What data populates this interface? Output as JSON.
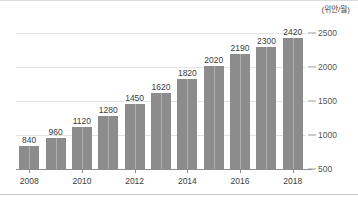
{
  "chart_data": {
    "type": "bar",
    "title": "",
    "subtitle": "",
    "unit_label": "(위안/월)",
    "xlabel": "",
    "ylabel": "",
    "categories": [
      "2008",
      "2009",
      "2010",
      "2011",
      "2012",
      "2013",
      "2014",
      "2015",
      "2016",
      "2017",
      "2018"
    ],
    "values": [
      840,
      960,
      1120,
      1280,
      1450,
      1620,
      1820,
      2020,
      2190,
      2300,
      2420
    ],
    "data_labels": [
      "840",
      "960",
      "1120",
      "1280",
      "1450",
      "1620",
      "1820",
      "2020",
      "2190",
      "2300",
      "2420"
    ],
    "ylim": [
      500,
      2500
    ],
    "ytick_values": [
      500,
      1000,
      1500,
      2000,
      2500
    ],
    "ytick_labels": [
      "500",
      "1000",
      "1500",
      "2000",
      "2500"
    ],
    "xtick_labels": [
      "2008",
      "2010",
      "2012",
      "2014",
      "2016",
      "2018"
    ],
    "xtick_categories": [
      "2008",
      "2010",
      "2012",
      "2014",
      "2016",
      "2018"
    ],
    "grid": true,
    "grid_axis": "y",
    "legend": false,
    "legend_position": "none",
    "y_axis_position": "right",
    "bar_color": "#8c8c8c",
    "gridline_color": "#e2e2e2",
    "axis_color": "#8d8d8d",
    "text_color": "#3c3c3c",
    "background": "#ffffff"
  }
}
